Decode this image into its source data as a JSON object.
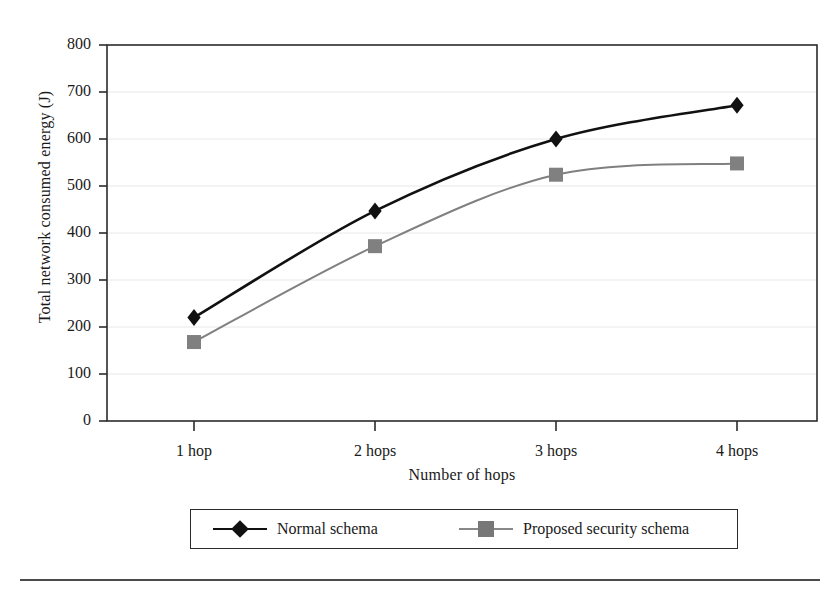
{
  "chart_data": {
    "type": "line",
    "title": "",
    "xlabel": "Number of hops",
    "ylabel": "Total network consumed energy (J)",
    "categories": [
      "1 hop",
      "2 hops",
      "3 hops",
      "4 hops"
    ],
    "x_tick_labels": [
      "1 hop",
      "2 hops",
      "3 hops",
      "4 hops"
    ],
    "y_tick_labels": [
      "0",
      "100",
      "200",
      "300",
      "400",
      "500",
      "600",
      "700",
      "800"
    ],
    "ylim": [
      0,
      800
    ],
    "y_tick_step": 100,
    "grid": "horizontal",
    "legend_position": "below-plot",
    "smoothing": "spline",
    "series": [
      {
        "name": "Normal schema",
        "values": [
          220,
          447,
          600,
          672
        ],
        "color": "#111111",
        "marker": "diamond",
        "line_width": 2.6
      },
      {
        "name": "Proposed security schema",
        "values": [
          168,
          372,
          524,
          548
        ],
        "color": "#808080",
        "marker": "square",
        "line_width": 2.0
      }
    ]
  },
  "legend": {
    "entries": [
      {
        "label": "Normal schema",
        "marker": "diamond-marker",
        "color": "#111111"
      },
      {
        "label": "Proposed security schema",
        "marker": "square-marker",
        "color": "#777777"
      }
    ]
  },
  "colors": {
    "axis": "#2b2b2b",
    "grid": "#e8e8e8",
    "text": "#1a1a1a",
    "series_normal": "#111111",
    "series_proposed": "#808080",
    "rule": "#4a4a4a"
  },
  "geometry": {
    "plot_left": 107,
    "plot_right": 817,
    "plot_top": 45,
    "plot_bottom": 421,
    "x_ticks_px": [
      194,
      375,
      556,
      737
    ]
  }
}
